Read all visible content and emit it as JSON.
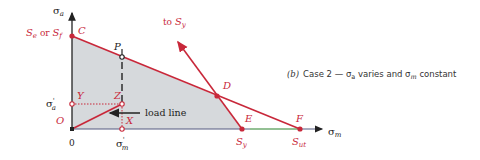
{
  "diagram": {
    "colors": {
      "line": "#c8283a",
      "region_fill": "#d6d9dc",
      "axis": "#222222",
      "text_red": "#c8283a",
      "text_dark": "#222222"
    },
    "axes": {
      "y_label_base": "σ",
      "y_label_sub": "a",
      "x_label_base": "σ",
      "x_label_sub": "m",
      "origin_label": "0"
    },
    "points": {
      "C": "C",
      "P": "P",
      "Z": "Z",
      "Y": "Y",
      "X": "X",
      "O": "O",
      "D": "D",
      "E": "E",
      "F": "F"
    },
    "labels": {
      "se_or_sf_1": "S",
      "se_sub": "e",
      "or": " or ",
      "sf_2": "S",
      "sf_sub": "f",
      "to_sy_prefix": "to ",
      "to_sy_S": "S",
      "to_sy_sub": "y",
      "sy_S": "S",
      "sy_sub": "y",
      "sut_S": "S",
      "sut_sub": "ut",
      "sigma_a_prime_base": "σ",
      "sigma_a_prime_mark": "'",
      "sigma_a_prime_sub": "a",
      "sigma_m_prime_base": "σ",
      "sigma_m_prime_mark": "'",
      "sigma_m_prime_sub": "m",
      "load_line": "load line"
    },
    "caption": {
      "part": "(b)",
      "text_1": "Case 2 — σ",
      "sub_a": "a",
      "text_2": " varies and σ",
      "sub_m": "m",
      "text_3": " constant"
    }
  }
}
